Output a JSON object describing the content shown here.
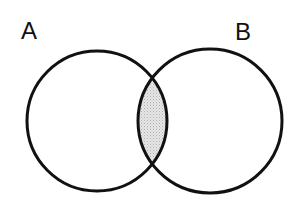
{
  "diagram": {
    "type": "venn",
    "sets": [
      {
        "label": "A",
        "cx": 97,
        "cy": 121,
        "r": 70
      },
      {
        "label": "B",
        "cx": 210,
        "cy": 121,
        "r": 72
      }
    ],
    "shaded_region": "A ∩ B",
    "colors": {
      "stroke": "#111111",
      "shade": "#d9d9d9",
      "background": "#ffffff"
    }
  }
}
